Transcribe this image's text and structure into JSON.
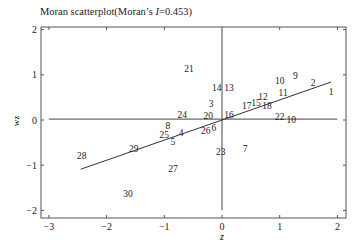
{
  "chart_data": {
    "type": "scatter",
    "title_prefix": "Moran scatterplot(Moran’s ",
    "title_italic": "I",
    "title_suffix": "=0.453)",
    "xlabel": "z",
    "ylabel": "wz",
    "xlim": [
      -3.1,
      2.15
    ],
    "ylim": [
      -2.1,
      2.1
    ],
    "xticks": [
      -3,
      -2,
      -1,
      0,
      1,
      2
    ],
    "yticks": [
      -2,
      -1,
      0,
      1,
      2
    ],
    "grid": false,
    "legend": null,
    "morans_i": 0.453,
    "reference_lines": {
      "horizontal_y": 0.02,
      "vertical_x": 0
    },
    "regression_line": {
      "x": [
        -2.45,
        1.89
      ],
      "y": [
        -1.09,
        0.84
      ]
    },
    "points": [
      {
        "label": "1",
        "x": 1.89,
        "y": 0.64
      },
      {
        "label": "2",
        "x": 1.58,
        "y": 0.84
      },
      {
        "label": "3",
        "x": -0.19,
        "y": 0.36
      },
      {
        "label": "4",
        "x": -0.71,
        "y": -0.27
      },
      {
        "label": "5",
        "x": -0.85,
        "y": -0.47
      },
      {
        "label": "6",
        "x": -0.14,
        "y": -0.16
      },
      {
        "label": "7",
        "x": 0.4,
        "y": -0.64
      },
      {
        "label": "8",
        "x": -0.94,
        "y": -0.13
      },
      {
        "label": "9",
        "x": 1.27,
        "y": 0.98
      },
      {
        "label": "10",
        "x": 1.0,
        "y": 0.87
      },
      {
        "label": "10",
        "x": 1.2,
        "y": 0.02
      },
      {
        "label": "11",
        "x": 1.06,
        "y": 0.6
      },
      {
        "label": "12",
        "x": 0.71,
        "y": 0.51
      },
      {
        "label": "13",
        "x": 0.12,
        "y": 0.71
      },
      {
        "label": "14",
        "x": -0.09,
        "y": 0.71
      },
      {
        "label": "15",
        "x": 0.59,
        "y": 0.38
      },
      {
        "label": "16",
        "x": 0.12,
        "y": 0.13
      },
      {
        "label": "17",
        "x": 0.43,
        "y": 0.33
      },
      {
        "label": "18",
        "x": 0.78,
        "y": 0.31
      },
      {
        "label": "20",
        "x": -0.24,
        "y": 0.09
      },
      {
        "label": "21",
        "x": -0.57,
        "y": 1.13
      },
      {
        "label": "22",
        "x": 1.0,
        "y": 0.07
      },
      {
        "label": "23",
        "x": -0.02,
        "y": -0.69
      },
      {
        "label": "24",
        "x": -0.69,
        "y": 0.13
      },
      {
        "label": "25",
        "x": -1.0,
        "y": -0.31
      },
      {
        "label": "26",
        "x": -0.28,
        "y": -0.24
      },
      {
        "label": "27",
        "x": -0.85,
        "y": -1.07
      },
      {
        "label": "28",
        "x": -2.43,
        "y": -0.78
      },
      {
        "label": "29",
        "x": -1.53,
        "y": -0.62
      },
      {
        "label": "30",
        "x": -1.63,
        "y": -1.62
      }
    ]
  }
}
